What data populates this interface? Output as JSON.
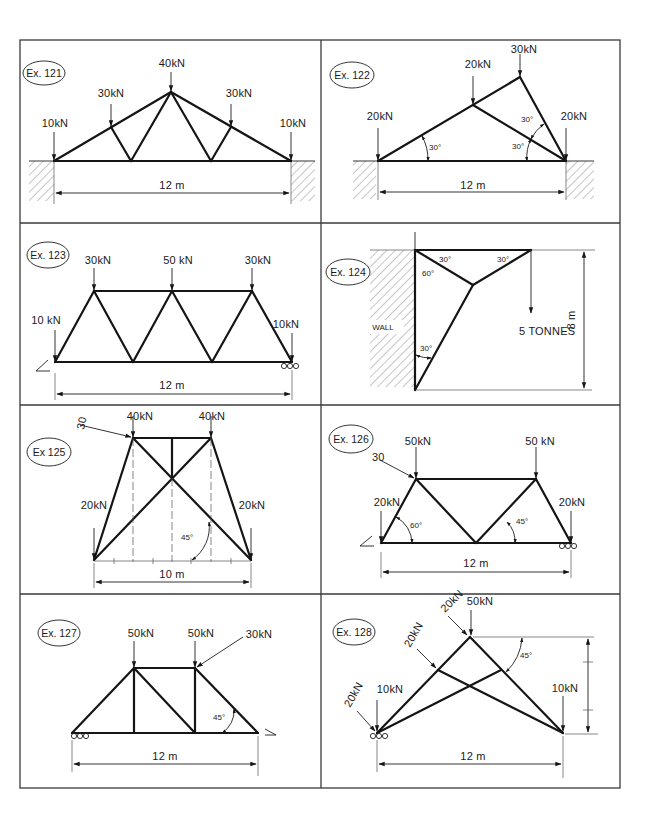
{
  "colors": {
    "ink": "#151515",
    "paper": "#ffffff",
    "frame": "#3a3a3a"
  },
  "examples": [
    {
      "id": "ex121",
      "tag": "Ex. 121",
      "loads": [
        "10kN",
        "30kN",
        "40kN",
        "30kN",
        "10kN"
      ],
      "span": "12 m"
    },
    {
      "id": "ex122",
      "tag": "Ex. 122",
      "loads": [
        "20kN",
        "20kN",
        "30kN",
        "20kN"
      ],
      "angles": [
        "30°",
        "30°",
        "30°"
      ],
      "span": "12 m"
    },
    {
      "id": "ex123",
      "tag": "Ex. 123",
      "loads": [
        "10 kN",
        "30kN",
        "50 kN",
        "30kN",
        "10kN"
      ],
      "span": "12 m"
    },
    {
      "id": "ex124",
      "tag": "Ex. 124",
      "angles": [
        "30°",
        "30°",
        "60°",
        "30°"
      ],
      "wall_label": "WALL",
      "load": "5 TONNES",
      "height": "8 m"
    },
    {
      "id": "ex125",
      "tag": "Ex 125",
      "loads": [
        "30",
        "40kN",
        "40kN",
        "20kN",
        "20kN"
      ],
      "angles": [
        "45°"
      ],
      "span": "10 m"
    },
    {
      "id": "ex126",
      "tag": "Ex. 126",
      "loads": [
        "30",
        "50kN",
        "50 kN",
        "20kN",
        "20kN"
      ],
      "angles": [
        "60°",
        "45°"
      ],
      "span": "12 m"
    },
    {
      "id": "ex127",
      "tag": "Ex. 127",
      "loads": [
        "50kN",
        "50kN",
        "30kN"
      ],
      "angles": [
        "45°"
      ],
      "span": "12 m"
    },
    {
      "id": "ex128",
      "tag": "Ex. 128",
      "loads": [
        "20kN",
        "50kN",
        "20kN",
        "20kN",
        "10kN",
        "10kN"
      ],
      "angles": [
        "45°"
      ],
      "span": "12 m"
    }
  ]
}
